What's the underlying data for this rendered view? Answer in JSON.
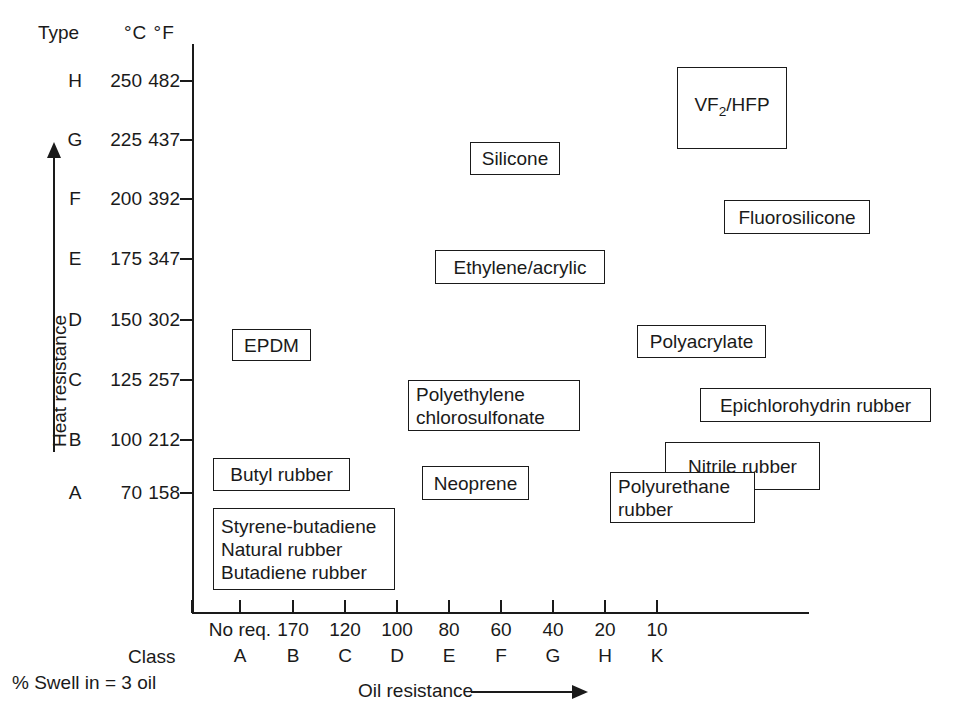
{
  "header": {
    "type_label": "Type",
    "units_label": "°C °F"
  },
  "axes": {
    "y_axis_title": "Heat resistance",
    "x_axis_title": "Oil resistance",
    "class_label": "Class",
    "swell_note": "% Swell in = 3 oil"
  },
  "y_ticks": [
    {
      "type": "H",
      "c": "250",
      "f": "482",
      "y": 81
    },
    {
      "type": "G",
      "c": "225",
      "f": "437",
      "y": 140
    },
    {
      "type": "F",
      "c": "200",
      "f": "392",
      "y": 199
    },
    {
      "type": "E",
      "c": "175",
      "f": "347",
      "y": 259
    },
    {
      "type": "D",
      "c": "150",
      "f": "302",
      "y": 320
    },
    {
      "type": "C",
      "c": "125",
      "f": "257",
      "y": 380
    },
    {
      "type": "B",
      "c": "100",
      "f": "212",
      "y": 440
    },
    {
      "type": "A",
      "c": "70",
      "f": "158",
      "y": 493
    }
  ],
  "x_ticks": [
    {
      "value": "No req.",
      "class": "A",
      "x": 240
    },
    {
      "value": "170",
      "class": "B",
      "x": 293
    },
    {
      "value": "120",
      "class": "C",
      "x": 345
    },
    {
      "value": "100",
      "class": "D",
      "x": 397
    },
    {
      "value": "80",
      "class": "E",
      "x": 449
    },
    {
      "value": "60",
      "class": "F",
      "x": 501
    },
    {
      "value": "40",
      "class": "G",
      "x": 553
    },
    {
      "value": "20",
      "class": "H",
      "x": 605
    },
    {
      "value": "10",
      "class": "K",
      "x": 657
    }
  ],
  "x_tick_marks": [
    192,
    240,
    293,
    345,
    397,
    449,
    501,
    553,
    605,
    657
  ],
  "chart_data": {
    "type": "scatter",
    "title": "",
    "xlabel": "Oil resistance",
    "ylabel": "Heat resistance",
    "grid": false,
    "legend": "none",
    "x_axis": {
      "name": "Oil resistance — % Swell in = 3 oil",
      "tick_values": [
        "No req.",
        "170",
        "120",
        "100",
        "80",
        "60",
        "40",
        "20",
        "10"
      ],
      "tick_classes": [
        "A",
        "B",
        "C",
        "D",
        "E",
        "F",
        "G",
        "H",
        "K"
      ],
      "direction": "increasing oil resistance to the right"
    },
    "y_axis": {
      "name": "Heat resistance",
      "types": [
        "A",
        "B",
        "C",
        "D",
        "E",
        "F",
        "G",
        "H"
      ],
      "celsius": [
        70,
        100,
        125,
        150,
        175,
        200,
        225,
        250
      ],
      "fahrenheit": [
        158,
        212,
        257,
        302,
        347,
        392,
        437,
        482
      ],
      "direction": "increasing heat resistance upward"
    },
    "items": [
      {
        "name": "VF2/HFP",
        "html": "VF<sub>2</sub>/HFP",
        "type_range": [
          "G",
          "H"
        ],
        "class_range": [
          "G",
          "H"
        ],
        "box": {
          "x": 677,
          "y": 67,
          "w": 110,
          "h": 82
        },
        "align": "center"
      },
      {
        "name": "Silicone",
        "html": "Silicone",
        "type_range": [
          "G"
        ],
        "class_range": [
          "E"
        ],
        "box": {
          "x": 470,
          "y": 142,
          "w": 90,
          "h": 33
        },
        "align": "center"
      },
      {
        "name": "Fluorosilicone",
        "html": "Fluorosilicone",
        "type_range": [
          "F"
        ],
        "class_range": [
          "H",
          "K"
        ],
        "box": {
          "x": 724,
          "y": 200,
          "w": 146,
          "h": 34
        },
        "align": "center"
      },
      {
        "name": "Ethylene/acrylic",
        "html": "Ethylene/acrylic",
        "type_range": [
          "E"
        ],
        "class_range": [
          "D",
          "F"
        ],
        "box": {
          "x": 435,
          "y": 250,
          "w": 170,
          "h": 34
        },
        "align": "center"
      },
      {
        "name": "EPDM",
        "html": "EPDM",
        "type_range": [
          "D"
        ],
        "class_range": [
          "A"
        ],
        "box": {
          "x": 232,
          "y": 329,
          "w": 79,
          "h": 32
        },
        "align": "center"
      },
      {
        "name": "Polyacrylate",
        "html": "Polyacrylate",
        "type_range": [
          "D"
        ],
        "class_range": [
          "G"
        ],
        "box": {
          "x": 637,
          "y": 325,
          "w": 129,
          "h": 33
        },
        "align": "center"
      },
      {
        "name": "Polyethylene chlorosulfonate",
        "html": "Polyethylene\nchlorosulfonate",
        "type_range": [
          "C"
        ],
        "class_range": [
          "C",
          "F"
        ],
        "box": {
          "x": 408,
          "y": 380,
          "w": 172,
          "h": 51
        },
        "align": "left"
      },
      {
        "name": "Epichlorohydrin rubber",
        "html": "Epichlorohydrin rubber",
        "type_range": [
          "C"
        ],
        "class_range": [
          "H",
          "K"
        ],
        "box": {
          "x": 700,
          "y": 388,
          "w": 231,
          "h": 34
        },
        "align": "center"
      },
      {
        "name": "Nitrile rubber",
        "html": "Nitrile rubber",
        "type_range": [
          "B"
        ],
        "class_range": [
          "G",
          "K"
        ],
        "box": {
          "x": 665,
          "y": 442,
          "w": 155,
          "h": 48
        },
        "align": "center"
      },
      {
        "name": "Butyl rubber",
        "html": "Butyl rubber",
        "type_range": [
          "B"
        ],
        "class_range": [
          "A"
        ],
        "box": {
          "x": 213,
          "y": 458,
          "w": 137,
          "h": 33
        },
        "align": "center"
      },
      {
        "name": "Neoprene",
        "html": "Neoprene",
        "type_range": [
          "B"
        ],
        "class_range": [
          "D"
        ],
        "box": {
          "x": 422,
          "y": 466,
          "w": 107,
          "h": 34
        },
        "align": "center"
      },
      {
        "name": "Polyurethane rubber",
        "html": "Polyurethane\nrubber",
        "type_range": [
          "B"
        ],
        "class_range": [
          "F",
          "H"
        ],
        "box": {
          "x": 610,
          "y": 472,
          "w": 145,
          "h": 51
        },
        "align": "left"
      },
      {
        "name": "Styrene-butadiene / Natural rubber / Butadiene rubber",
        "html": "Styrene-butadiene\nNatural rubber\nButadiene rubber",
        "type_range": [
          "A"
        ],
        "class_range": [
          "A",
          "B"
        ],
        "box": {
          "x": 213,
          "y": 508,
          "w": 182,
          "h": 82
        },
        "align": "left"
      }
    ]
  }
}
